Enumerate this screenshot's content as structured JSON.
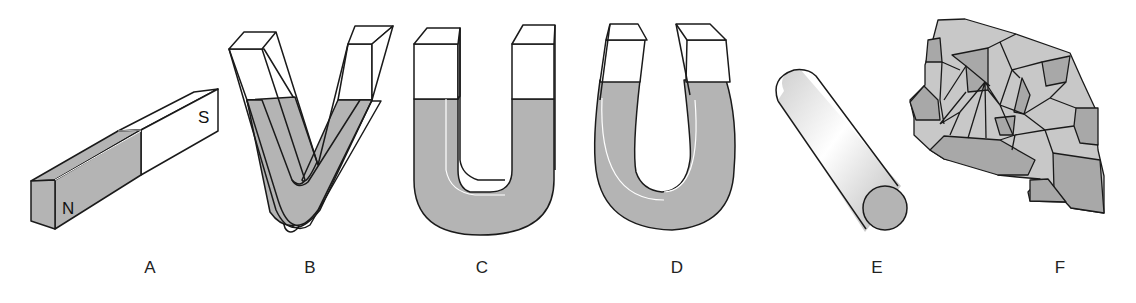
{
  "figure": {
    "colors": {
      "magnetized_fill": "#b4b4b4",
      "unmagnetized_fill": "#ffffff",
      "outline": "#1a1a1a",
      "fragment_light": "#c8c8c8",
      "fragment_dark": "#a8a8a8",
      "background": "#ffffff"
    },
    "items": [
      {
        "id": "A",
        "label": "A",
        "shape": "bar magnet",
        "poles": {
          "north": "N",
          "south": "S"
        }
      },
      {
        "id": "B",
        "label": "B",
        "shape": "V-shaped magnet"
      },
      {
        "id": "C",
        "label": "C",
        "shape": "U-shaped magnet"
      },
      {
        "id": "D",
        "label": "D",
        "shape": "horseshoe magnet"
      },
      {
        "id": "E",
        "label": "E",
        "shape": "cylindrical rod magnet"
      },
      {
        "id": "F",
        "label": "F",
        "shape": "lodestone / irregular magnetite fragment"
      }
    ]
  }
}
